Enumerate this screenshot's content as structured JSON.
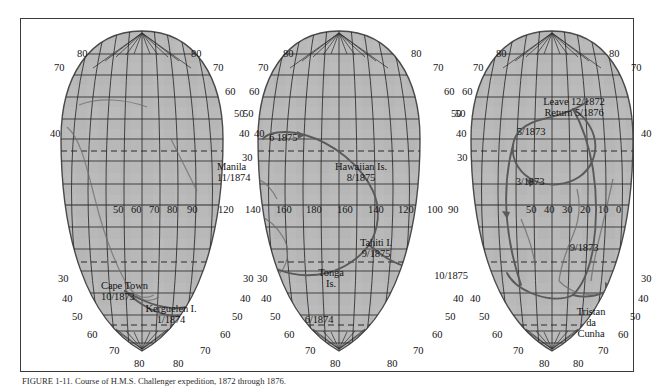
{
  "figure": {
    "caption": "FIGURE 1-11. Course of H.M.S. Challenger expedition, 1872 through 1876.",
    "map_type": "interrupted-sinusoidal-world-map",
    "fill_color": "#b8b8b8",
    "graticule_color": "#2b2b2b",
    "route_color": "#5a5a5a",
    "border_color": "#3a3a3a",
    "tropic_line_style": "dashed"
  },
  "latitude_labels": {
    "values": [
      "80",
      "70",
      "60",
      "50",
      "40",
      "30"
    ],
    "lobe_left_west": [
      {
        "text": "80",
        "x": 56,
        "y": 30
      },
      {
        "text": "70",
        "x": 33,
        "y": 44
      },
      {
        "text": "40",
        "x": 29,
        "y": 110
      },
      {
        "text": "30",
        "x": 37,
        "y": 255
      },
      {
        "text": "40",
        "x": 41,
        "y": 275
      },
      {
        "text": "50",
        "x": 51,
        "y": 293
      },
      {
        "text": "60",
        "x": 66,
        "y": 311
      },
      {
        "text": "70",
        "x": 88,
        "y": 327
      },
      {
        "text": "80",
        "x": 113,
        "y": 340
      }
    ],
    "lobe_left_east": [
      {
        "text": "80",
        "x": 170,
        "y": 30
      },
      {
        "text": "70",
        "x": 192,
        "y": 44
      },
      {
        "text": "60",
        "x": 204,
        "y": 68
      },
      {
        "text": "50",
        "x": 213,
        "y": 90
      },
      {
        "text": "40",
        "x": 218,
        "y": 110
      },
      {
        "text": "30",
        "x": 221,
        "y": 134
      },
      {
        "text": "30",
        "x": 222,
        "y": 255
      },
      {
        "text": "40",
        "x": 219,
        "y": 275
      },
      {
        "text": "50",
        "x": 211,
        "y": 293
      },
      {
        "text": "60",
        "x": 199,
        "y": 311
      },
      {
        "text": "70",
        "x": 179,
        "y": 327
      },
      {
        "text": "80",
        "x": 152,
        "y": 340
      }
    ],
    "lobe_mid_west": [
      {
        "text": "80",
        "x": 262,
        "y": 30
      },
      {
        "text": "70",
        "x": 237,
        "y": 44
      },
      {
        "text": "60",
        "x": 228,
        "y": 68
      },
      {
        "text": "50",
        "x": 222,
        "y": 90
      },
      {
        "text": "40",
        "x": 233,
        "y": 110
      },
      {
        "text": "30",
        "x": 236,
        "y": 255
      },
      {
        "text": "40",
        "x": 240,
        "y": 275
      },
      {
        "text": "50",
        "x": 249,
        "y": 293
      },
      {
        "text": "60",
        "x": 263,
        "y": 311
      },
      {
        "text": "70",
        "x": 284,
        "y": 327
      },
      {
        "text": "80",
        "x": 309,
        "y": 340
      }
    ],
    "lobe_mid_east": [
      {
        "text": "80",
        "x": 390,
        "y": 30
      },
      {
        "text": "70",
        "x": 412,
        "y": 44
      },
      {
        "text": "60",
        "x": 423,
        "y": 68
      },
      {
        "text": "50",
        "x": 430,
        "y": 90
      },
      {
        "text": "40",
        "x": 435,
        "y": 110
      },
      {
        "text": "30",
        "x": 436,
        "y": 134
      },
      {
        "text": "40",
        "x": 432,
        "y": 275
      },
      {
        "text": "50",
        "x": 424,
        "y": 293
      },
      {
        "text": "60",
        "x": 411,
        "y": 311
      },
      {
        "text": "70",
        "x": 392,
        "y": 327
      },
      {
        "text": "80",
        "x": 366,
        "y": 340
      }
    ],
    "lobe_right_west": [
      {
        "text": "80",
        "x": 475,
        "y": 30
      },
      {
        "text": "70",
        "x": 452,
        "y": 44
      },
      {
        "text": "60",
        "x": 441,
        "y": 68
      },
      {
        "text": "50",
        "x": 434,
        "y": 90
      },
      {
        "text": "40",
        "x": 449,
        "y": 275
      },
      {
        "text": "50",
        "x": 458,
        "y": 293
      },
      {
        "text": "60",
        "x": 471,
        "y": 311
      },
      {
        "text": "70",
        "x": 492,
        "y": 327
      },
      {
        "text": "80",
        "x": 518,
        "y": 340
      }
    ],
    "lobe_right_east": [
      {
        "text": "80",
        "x": 588,
        "y": 30
      },
      {
        "text": "70",
        "x": 610,
        "y": 44
      },
      {
        "text": "40",
        "x": 620,
        "y": 110
      },
      {
        "text": "30",
        "x": 620,
        "y": 255
      },
      {
        "text": "40",
        "x": 617,
        "y": 275
      },
      {
        "text": "50",
        "x": 609,
        "y": 293
      },
      {
        "text": "60",
        "x": 597,
        "y": 311
      },
      {
        "text": "70",
        "x": 577,
        "y": 327
      },
      {
        "text": "80",
        "x": 552,
        "y": 340
      }
    ]
  },
  "longitude_labels": {
    "equator_row_y": 186,
    "values": [
      {
        "text": "50",
        "x": 92
      },
      {
        "text": "60",
        "x": 110
      },
      {
        "text": "70",
        "x": 128
      },
      {
        "text": "80",
        "x": 146
      },
      {
        "text": "90",
        "x": 166
      },
      {
        "text": "120",
        "x": 197
      },
      {
        "text": "140",
        "x": 224
      },
      {
        "text": "160",
        "x": 255
      },
      {
        "text": "180",
        "x": 285
      },
      {
        "text": "160",
        "x": 316
      },
      {
        "text": "140",
        "x": 347
      },
      {
        "text": "120",
        "x": 377
      },
      {
        "text": "100",
        "x": 406
      },
      {
        "text": "90",
        "x": 427
      },
      {
        "text": "50",
        "x": 505
      },
      {
        "text": "40",
        "x": 523
      },
      {
        "text": "30",
        "x": 541
      },
      {
        "text": "20",
        "x": 559
      },
      {
        "text": "10",
        "x": 577
      },
      {
        "text": "0",
        "x": 595
      }
    ]
  },
  "annotations": [
    {
      "id": "manila",
      "lines": [
        "Manila",
        "11/1874"
      ],
      "x": 196,
      "y": 143,
      "align": "left"
    },
    {
      "id": "hawaiian-is",
      "lines": [
        "Hawaiian Is.",
        "8/1875"
      ],
      "x": 340,
      "y": 143,
      "align": "center"
    },
    {
      "id": "june-1875",
      "lines": [
        "6  1875"
      ],
      "x": 248,
      "y": 114,
      "align": "left"
    },
    {
      "id": "tahiti-i",
      "lines": [
        "Tahiti I.",
        "9/1875"
      ],
      "x": 355,
      "y": 219,
      "align": "center"
    },
    {
      "id": "tonga-is",
      "lines": [
        "Tonga",
        "Is."
      ],
      "x": 310,
      "y": 249,
      "align": "center"
    },
    {
      "id": "june-1874",
      "lines": [
        "6/1874"
      ],
      "x": 298,
      "y": 296,
      "align": "center"
    },
    {
      "id": "oct-1875",
      "lines": [
        "10/1875"
      ],
      "x": 430,
      "y": 252,
      "align": "center"
    },
    {
      "id": "cape-town",
      "lines": [
        "Cape Town",
        "10/1873"
      ],
      "x": 80,
      "y": 262,
      "align": "left"
    },
    {
      "id": "kerguelen-i",
      "lines": [
        "Kerguelen I.",
        "1/1874"
      ],
      "x": 150,
      "y": 285,
      "align": "center"
    },
    {
      "id": "leave-return",
      "lines": [
        "Leave 12/1872",
        "Return 5/1876"
      ],
      "x": 553,
      "y": 78,
      "align": "center"
    },
    {
      "id": "may-1873",
      "lines": [
        "5/1873"
      ],
      "x": 510,
      "y": 108,
      "align": "center"
    },
    {
      "id": "mar-1873",
      "lines": [
        "3/1873"
      ],
      "x": 509,
      "y": 158,
      "align": "center"
    },
    {
      "id": "sep-1873",
      "lines": [
        "9/1873"
      ],
      "x": 563,
      "y": 224,
      "align": "center"
    },
    {
      "id": "tristan-da-cunha",
      "lines": [
        "Tristan",
        "da",
        "Cunha"
      ],
      "x": 570,
      "y": 288,
      "align": "center"
    }
  ]
}
